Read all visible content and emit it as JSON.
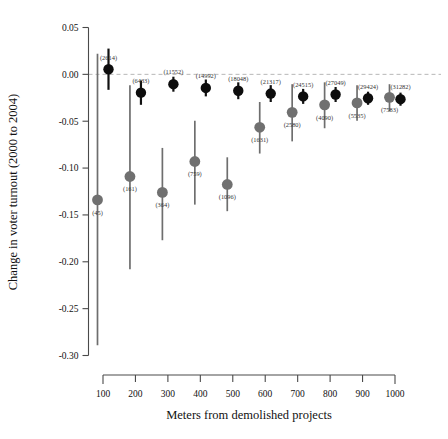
{
  "chart_data": {
    "type": "scatter",
    "title": "",
    "xlabel": "Meters from demolished projects",
    "ylabel": "Change in voter turnout (2000 to 2004)",
    "categories": [
      "100",
      "200",
      "300",
      "400",
      "500",
      "600",
      "700",
      "800",
      "900",
      "1000"
    ],
    "x": [
      100,
      200,
      300,
      400,
      500,
      600,
      700,
      800,
      900,
      1000
    ],
    "xlim": [
      50,
      1050
    ],
    "ylim": [
      -0.3,
      0.05
    ],
    "yticks": [
      "0.05",
      "0.00",
      "-0.05",
      "-0.10",
      "-0.15",
      "-0.20",
      "-0.25",
      "-0.30"
    ],
    "ytick_values": [
      0.05,
      0.0,
      -0.05,
      -0.1,
      -0.15,
      -0.2,
      -0.25,
      -0.3
    ],
    "grid": false,
    "legend_position": "none",
    "reference_line": 0.0,
    "series": [
      {
        "name": "Displaced residents (grey)",
        "color": "#707070",
        "values": [
          -0.134,
          -0.109,
          -0.126,
          -0.093,
          -0.1175,
          -0.0565,
          -0.0405,
          -0.0325,
          -0.0305,
          -0.0245
        ],
        "ci_low": [
          -0.289,
          -0.208,
          -0.177,
          -0.139,
          -0.146,
          -0.0845,
          -0.0715,
          -0.0575,
          -0.0495,
          -0.0395
        ],
        "ci_high": [
          0.022,
          -0.0115,
          -0.0785,
          -0.0495,
          -0.0885,
          -0.0295,
          -0.0105,
          -0.0085,
          -0.0115,
          -0.0105
        ],
        "n_labels": [
          "(45)",
          "(161)",
          "(364)",
          "(759)",
          "(1096)",
          "(1631)",
          "(2580)",
          "(4090)",
          "(5535)",
          "(7583)"
        ]
      },
      {
        "name": "Nearby non-displaced residents (black)",
        "color": "#0d0d0d",
        "values": [
          0.0055,
          -0.0195,
          -0.0105,
          -0.0145,
          -0.0175,
          -0.0205,
          -0.0235,
          -0.0215,
          -0.0255,
          -0.0265
        ],
        "ci_low": [
          -0.0165,
          -0.0325,
          -0.0185,
          -0.0235,
          -0.0265,
          -0.0295,
          -0.0315,
          -0.0295,
          -0.0325,
          -0.0335
        ],
        "ci_high": [
          0.0275,
          -0.0065,
          -0.0025,
          -0.0055,
          -0.0085,
          -0.0115,
          -0.0155,
          -0.0135,
          -0.0185,
          -0.0195
        ],
        "n_labels": [
          "(2614)",
          "(6433)",
          "(11552)",
          "(14992)",
          "(18048)",
          "(21317)",
          "(24515)",
          "(27049)",
          "(29424)",
          "(31282)"
        ]
      }
    ]
  }
}
